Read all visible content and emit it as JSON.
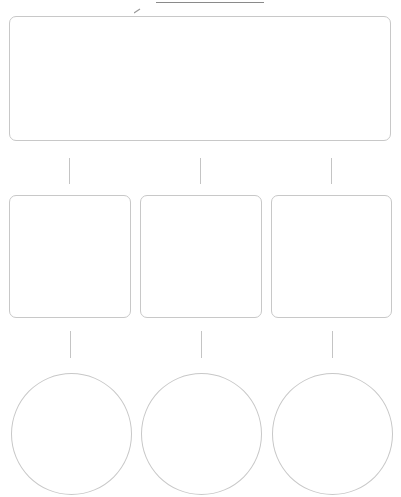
{
  "worksheet": {
    "name_field": {
      "value": ""
    },
    "main_idea_box": {
      "text": ""
    },
    "detail_boxes": [
      {
        "text": ""
      },
      {
        "text": ""
      },
      {
        "text": ""
      }
    ],
    "supporting_circles": [
      {
        "text": ""
      },
      {
        "text": ""
      },
      {
        "text": ""
      }
    ],
    "colors": {
      "outline": "#c8c8c8",
      "connector": "#c4c4c4",
      "name_line": "#8a8a8a",
      "background": "#ffffff"
    }
  }
}
